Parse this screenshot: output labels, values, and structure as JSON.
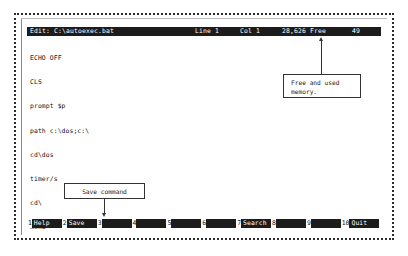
{
  "application": {
    "name": "MS-DOS Editor",
    "titlebar": {
      "title": "Edit: C:\\autoexec.bat",
      "line_indicator": "Line 1",
      "col_indicator": "Col 1",
      "memory_indicator": "28,626 Free",
      "right_indicator": "49"
    }
  },
  "document": {
    "filename": "autoexec.bat",
    "lines": [
      "ECHO OFF",
      "CLS",
      "prompt $p",
      "path c:\\dos;c:\\",
      "cd\\dos",
      "timer/s",
      "cd\\",
      "menu"
    ]
  },
  "function_keys": [
    {
      "number": "1",
      "label": "Help"
    },
    {
      "number": "2",
      "label": "Save"
    },
    {
      "number": "3",
      "label": ""
    },
    {
      "number": "4",
      "label": ""
    },
    {
      "number": "5",
      "label": ""
    },
    {
      "number": "6",
      "label": ""
    },
    {
      "number": "7",
      "label": "Search"
    },
    {
      "number": "8",
      "label": ""
    },
    {
      "number": "9",
      "label": ""
    },
    {
      "number": "10",
      "label": "Quit"
    }
  ],
  "annotations": {
    "memory": {
      "line1": "Free and used",
      "line2": "memory."
    },
    "save": {
      "line1": "Save command"
    }
  },
  "colors": {
    "screen_background": "#ffffff",
    "inverse_background": "#1c1c1c",
    "inverse_text": "#ffffff",
    "body_text": "#111111",
    "frame": "#2b2b2b",
    "callout_border": "#333333"
  }
}
